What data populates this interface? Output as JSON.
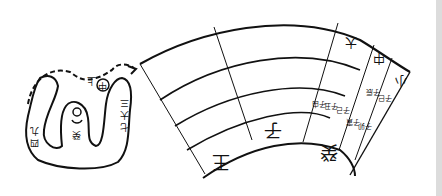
{
  "figure": {
    "left_diagram": {
      "labels": {
        "circle": "中",
        "top": "上",
        "center": "癸",
        "left_column": [
          "九",
          "四",
          "七"
        ],
        "right_column": [
          "三",
          "大",
          "七"
        ]
      }
    },
    "fan_diagram": {
      "bottom_band": [
        "王",
        "子",
        "癸"
      ],
      "top_band": [
        "大",
        "中",
        "小"
      ],
      "small_cells_row1": [
        "子由",
        "子丑",
        "子己"
      ],
      "small_cells_row2": [
        "子寅",
        "子卯"
      ],
      "right_small": [
        "子辰",
        "子巳"
      ]
    }
  },
  "colors": {
    "ink": "#111111",
    "paper": "#ffffff",
    "edge": "#dcdcdc"
  }
}
